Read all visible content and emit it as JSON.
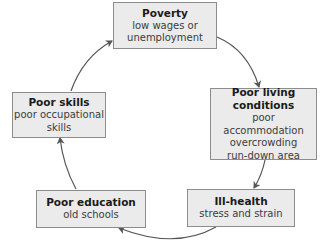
{
  "diagram": {
    "type": "cycle",
    "colors": {
      "box_fill": "#ebebeb",
      "box_border": "#8c8c8c",
      "arrow": "#555555",
      "text": "#1a1a1a"
    },
    "nodes": [
      {
        "id": "poverty",
        "title": "Poverty",
        "desc": [
          "low wages or",
          "unemployment"
        ]
      },
      {
        "id": "living",
        "title": [
          "Poor living",
          "conditions"
        ],
        "desc": [
          "poor accommodation",
          "overcrowding",
          "run-down area"
        ]
      },
      {
        "id": "health",
        "title": "Ill-health",
        "desc": [
          "stress and strain"
        ]
      },
      {
        "id": "education",
        "title": "Poor education",
        "desc": [
          "old schools"
        ]
      },
      {
        "id": "skills",
        "title": "Poor skills",
        "desc": [
          "poor occupational",
          "skills"
        ]
      }
    ],
    "edges": [
      {
        "from": "poverty",
        "to": "living"
      },
      {
        "from": "living",
        "to": "health"
      },
      {
        "from": "health",
        "to": "education"
      },
      {
        "from": "education",
        "to": "skills"
      },
      {
        "from": "skills",
        "to": "poverty"
      }
    ]
  }
}
